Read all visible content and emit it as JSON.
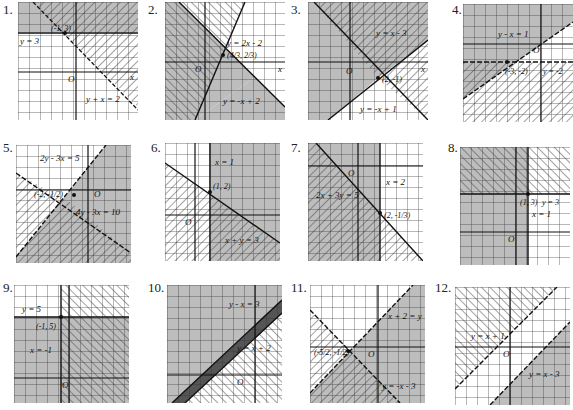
{
  "colors": {
    "background": "#ffffff",
    "shade": "#bdbdbd",
    "grid": "#333333",
    "hatch": "#444444",
    "line": "#111111"
  },
  "exercises": [
    {
      "number": "1.",
      "labels": [
        "y = 3",
        "(-1, 3)",
        "y + x = 2",
        "O",
        "x",
        "y"
      ]
    },
    {
      "number": "2.",
      "labels": [
        "y = 2x - 2",
        "(4/3, 2/3)",
        "y = -x + 2",
        "O",
        "x",
        "y"
      ]
    },
    {
      "number": "3.",
      "labels": [
        "y = x - 3",
        "(2, -1)",
        "y = -x + 1",
        "O",
        "x",
        "y"
      ]
    },
    {
      "number": "4.",
      "labels": [
        "y - x = 1",
        "(-3, -2)",
        "y = -2",
        "O",
        "x",
        "y"
      ]
    },
    {
      "number": "5.",
      "labels": [
        "2y - 3x = 5",
        "(-2, -1/2)",
        "4y - 3x = 10",
        "O",
        "x",
        "y"
      ]
    },
    {
      "number": "6.",
      "labels": [
        "x = 1",
        "(1, 2)",
        "x + y = 3",
        "O",
        "x",
        "y"
      ]
    },
    {
      "number": "7.",
      "labels": [
        "2x + 3y = 5",
        "x = 2",
        "(2, -1/3)",
        "O",
        "x",
        "y"
      ]
    },
    {
      "number": "8.",
      "labels": [
        "(1, 3)",
        "y = 3",
        "x = 1",
        "O",
        "x",
        "y"
      ]
    },
    {
      "number": "9.",
      "labels": [
        "y = 5",
        "(-1, 5)",
        "x = -1",
        "O",
        "x",
        "y"
      ]
    },
    {
      "number": "10.",
      "labels": [
        "y - x = 3",
        "y = x + 2",
        "O",
        "x",
        "y"
      ]
    },
    {
      "number": "11.",
      "labels": [
        "x + 2 = y",
        "(-5/2, -1/2)",
        "y = -x - 3",
        "O",
        "x",
        "y"
      ]
    },
    {
      "number": "12.",
      "labels": [
        "y = x + 1",
        "y = x - 3",
        "O",
        "x",
        "y"
      ]
    }
  ]
}
